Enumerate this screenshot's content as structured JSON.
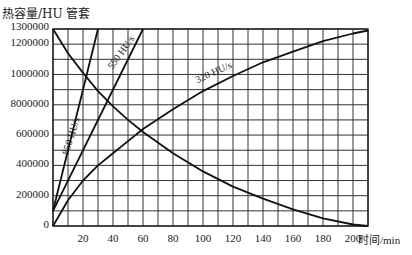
{
  "chart_data": {
    "type": "line",
    "title": "热容量/HU 管套",
    "xlabel": "时间/min",
    "ylabel": "热容量/HU",
    "xlim": [
      0,
      210
    ],
    "ylim": [
      0,
      1300000
    ],
    "grid": true,
    "x_ticks": [
      20,
      40,
      60,
      80,
      100,
      120,
      140,
      160,
      180,
      200
    ],
    "x_tick_labels": [
      "20",
      "40",
      "60",
      "80",
      "100",
      "120",
      "140",
      "160",
      "180",
      "200"
    ],
    "y_ticks": [
      0,
      200000,
      400000,
      600000,
      800000,
      1000000,
      1200000,
      1300000
    ],
    "y_tick_labels": [
      "0",
      "200000",
      "400000",
      "600000",
      "8000000",
      "1000000",
      "1200000",
      "1300000"
    ],
    "series": [
      {
        "name": "850 HU/s",
        "x": [
          0,
          30
        ],
        "values": [
          100000,
          1300000
        ]
      },
      {
        "name": "550 HU/s",
        "x": [
          0,
          60
        ],
        "values": [
          100000,
          1300000
        ]
      },
      {
        "name": "320 HU/s",
        "x": [
          0,
          10,
          20,
          30,
          40,
          50,
          60,
          80,
          100,
          120,
          140,
          160,
          180,
          200,
          210
        ],
        "values": [
          0,
          170000,
          300000,
          400000,
          480000,
          560000,
          640000,
          770000,
          890000,
          990000,
          1080000,
          1150000,
          1220000,
          1270000,
          1290000
        ]
      },
      {
        "name": "cooling",
        "x": [
          0,
          10,
          20,
          30,
          40,
          50,
          60,
          80,
          100,
          120,
          140,
          160,
          180,
          200,
          210
        ],
        "values": [
          1300000,
          1140000,
          1010000,
          890000,
          790000,
          700000,
          620000,
          480000,
          360000,
          260000,
          180000,
          110000,
          50000,
          10000,
          0
        ]
      }
    ],
    "annotations": [
      {
        "text": "850 HU/s",
        "x": 12,
        "y": 640000,
        "angle": -72
      },
      {
        "text": "550 HU/s",
        "x": 42,
        "y": 1040000,
        "angle": -52
      },
      {
        "text": "320 HU/s",
        "x": 95,
        "y": 930000,
        "angle": -24
      }
    ]
  }
}
